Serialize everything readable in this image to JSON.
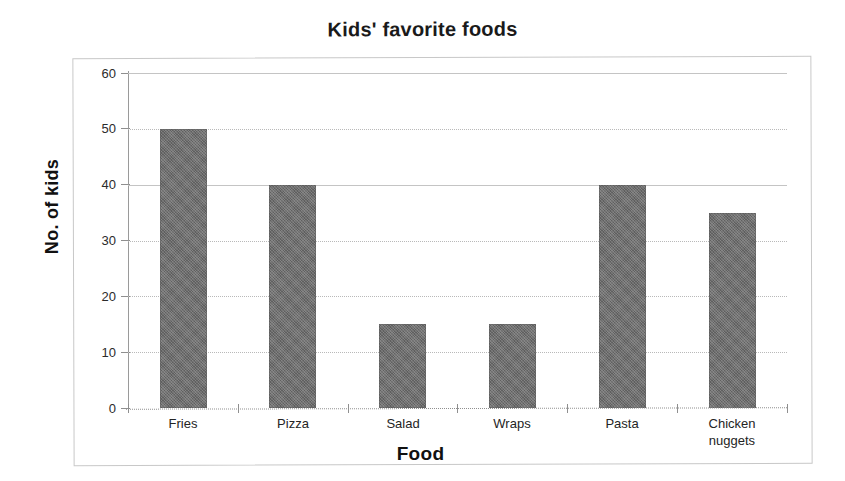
{
  "chart_data": {
    "type": "bar",
    "title": "Kids' favorite foods",
    "xlabel": "Food",
    "ylabel": "No. of kids",
    "categories": [
      "Fries",
      "Pizza",
      "Salad",
      "Wraps",
      "Pasta",
      "Chicken nuggets"
    ],
    "category_lines": [
      [
        "Fries"
      ],
      [
        "Pizza"
      ],
      [
        "Salad"
      ],
      [
        "Wraps"
      ],
      [
        "Pasta"
      ],
      [
        "Chicken",
        "nuggets"
      ]
    ],
    "values": [
      50,
      40,
      15,
      15,
      40,
      35
    ],
    "ylim": [
      0,
      60
    ],
    "yticks": [
      0,
      10,
      20,
      30,
      40,
      50,
      60
    ],
    "ytick_labels": [
      "0",
      "10",
      "20",
      "30",
      "40",
      "50",
      "60"
    ],
    "grid": true,
    "legend": false,
    "bar_color": "#6f6f6f",
    "grid_color": "#b9b9b9",
    "axis_color": "#8f8f8f",
    "border_color": "#c8c8c8",
    "text_color": "#1a1a1a"
  },
  "figure": {
    "title": "Kids' favorite foods",
    "x_axis_title": "Food",
    "y_axis_title": "No. of kids"
  },
  "y_axis": {
    "ticks": [
      {
        "label": "60",
        "value": 60
      },
      {
        "label": "50",
        "value": 50
      },
      {
        "label": "40",
        "value": 40
      },
      {
        "label": "30",
        "value": 30
      },
      {
        "label": "20",
        "value": 20
      },
      {
        "label": "10",
        "value": 10
      },
      {
        "label": "0",
        "value": 0
      }
    ]
  },
  "bars": [
    {
      "category": "Fries",
      "line1": "Fries",
      "line2": "",
      "value": 50
    },
    {
      "category": "Pizza",
      "line1": "Pizza",
      "line2": "",
      "value": 40
    },
    {
      "category": "Salad",
      "line1": "Salad",
      "line2": "",
      "value": 15
    },
    {
      "category": "Wraps",
      "line1": "Wraps",
      "line2": "",
      "value": 15
    },
    {
      "category": "Pasta",
      "line1": "Pasta",
      "line2": "",
      "value": 40
    },
    {
      "category": "Chicken nuggets",
      "line1": "Chicken",
      "line2": "nuggets",
      "value": 35
    }
  ]
}
